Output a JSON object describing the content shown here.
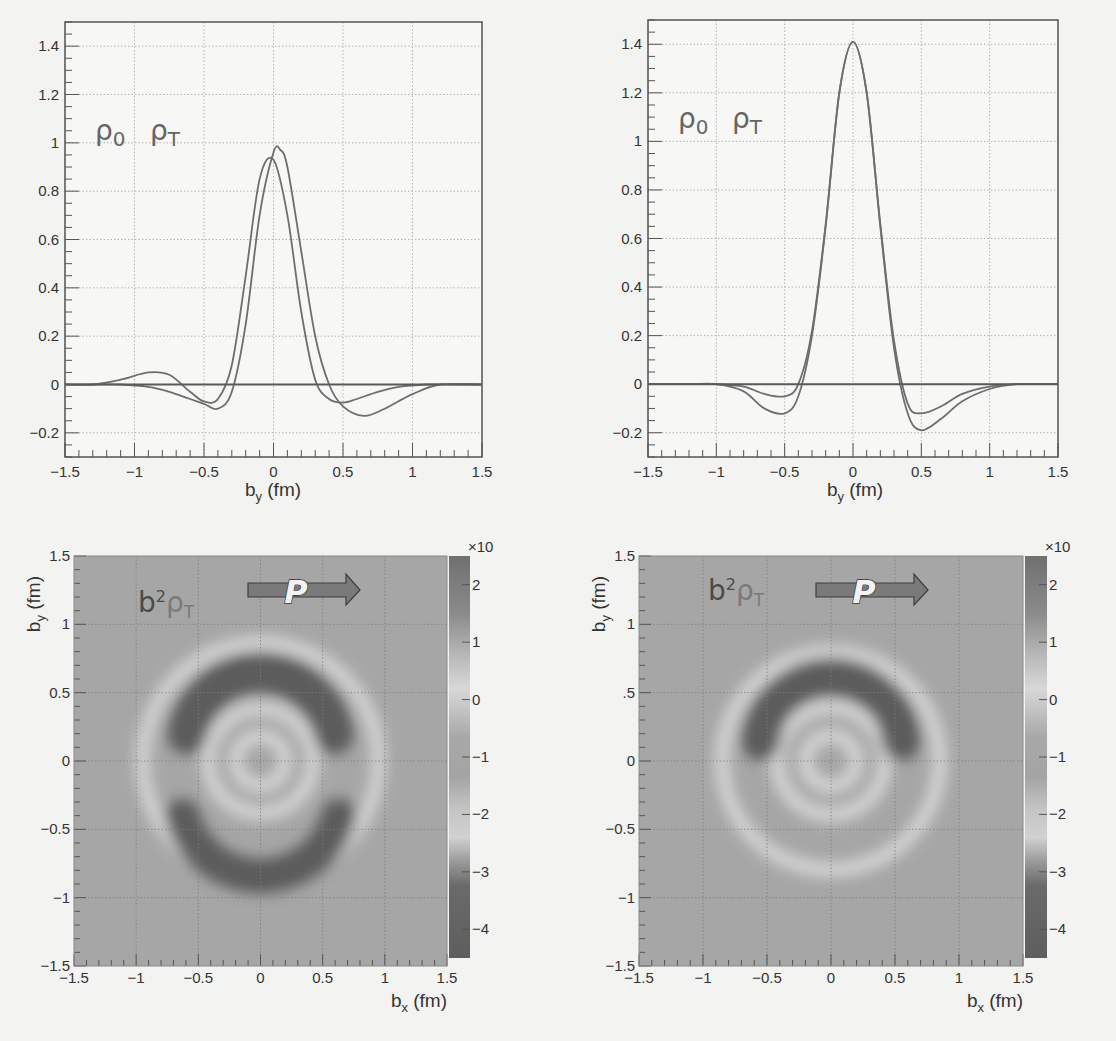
{
  "chart_data": [
    {
      "id": "top_left",
      "type": "line",
      "title": "",
      "legend": [
        "ρ0",
        "ρT"
      ],
      "xlabel": "b_y (fm)",
      "ylabel": "",
      "xlim": [
        -1.5,
        1.5
      ],
      "ylim": [
        -0.3,
        1.5
      ],
      "xticks": [
        "-1.5",
        "-1",
        "-0.5",
        "0",
        "0.5",
        "1",
        "1.5"
      ],
      "yticks": [
        "-0.2",
        "0",
        "0.2",
        "0.4",
        "0.6",
        "0.8",
        "1",
        "1.2",
        "1.4"
      ],
      "grid": true,
      "series": [
        {
          "name": "ρ0",
          "x": [
            -1.5,
            -1.3,
            -1.1,
            -0.9,
            -0.75,
            -0.6,
            -0.5,
            -0.4,
            -0.3,
            -0.2,
            -0.1,
            0,
            0.1,
            0.2,
            0.3,
            0.4,
            0.5,
            0.6,
            0.75,
            0.9,
            1.1,
            1.3,
            1.5
          ],
          "y": [
            0,
            0,
            0.02,
            0.05,
            0.04,
            -0.03,
            -0.07,
            -0.06,
            0.08,
            0.45,
            0.85,
            0.93,
            0.7,
            0.3,
            0.02,
            -0.06,
            -0.075,
            -0.06,
            -0.03,
            -0.01,
            0,
            0,
            0
          ]
        },
        {
          "name": "ρT",
          "x": [
            -1.5,
            -1.3,
            -1.1,
            -0.9,
            -0.75,
            -0.6,
            -0.5,
            -0.4,
            -0.3,
            -0.2,
            -0.1,
            0,
            0.05,
            0.1,
            0.2,
            0.3,
            0.4,
            0.5,
            0.65,
            0.8,
            1.0,
            1.2,
            1.5
          ],
          "y": [
            0,
            0,
            0,
            -0.01,
            -0.03,
            -0.06,
            -0.08,
            -0.1,
            -0.03,
            0.25,
            0.7,
            0.96,
            0.97,
            0.9,
            0.55,
            0.2,
            0.0,
            -0.09,
            -0.13,
            -0.1,
            -0.04,
            0,
            0
          ]
        },
        {
          "name": "zero",
          "x": [
            -1.5,
            1.5
          ],
          "y": [
            0,
            0
          ]
        }
      ]
    },
    {
      "id": "top_right",
      "type": "line",
      "title": "",
      "legend": [
        "ρ0",
        "ρT"
      ],
      "xlabel": "b_y (fm)",
      "ylabel": "",
      "xlim": [
        -1.5,
        1.5
      ],
      "ylim": [
        -0.3,
        1.5
      ],
      "xticks": [
        "-1.5",
        "-1",
        "-0.5",
        "0",
        "0.5",
        "1",
        "1.5"
      ],
      "yticks": [
        "-0.2",
        "0",
        "0.2",
        "0.4",
        "0.6",
        "0.8",
        "1",
        "1.2",
        "1.4"
      ],
      "grid": true,
      "series": [
        {
          "name": "ρ0",
          "x": [
            -1.5,
            -1.2,
            -1.0,
            -0.8,
            -0.65,
            -0.5,
            -0.4,
            -0.3,
            -0.2,
            -0.1,
            0,
            0.1,
            0.2,
            0.3,
            0.4,
            0.5,
            0.65,
            0.8,
            1.0,
            1.2,
            1.5
          ],
          "y": [
            0,
            0,
            0,
            -0.03,
            -0.1,
            -0.12,
            -0.05,
            0.2,
            0.65,
            1.2,
            1.41,
            1.2,
            0.65,
            0.15,
            -0.12,
            -0.19,
            -0.14,
            -0.07,
            -0.02,
            0,
            0
          ]
        },
        {
          "name": "ρT",
          "x": [
            -1.5,
            -1.2,
            -1.0,
            -0.8,
            -0.65,
            -0.5,
            -0.4,
            -0.3,
            -0.2,
            -0.1,
            0,
            0.1,
            0.2,
            0.3,
            0.4,
            0.5,
            0.65,
            0.8,
            1.0,
            1.2,
            1.5
          ],
          "y": [
            0,
            0,
            0,
            -0.01,
            -0.04,
            -0.05,
            0.0,
            0.22,
            0.66,
            1.2,
            1.41,
            1.2,
            0.66,
            0.18,
            -0.08,
            -0.12,
            -0.09,
            -0.04,
            -0.01,
            0,
            0
          ]
        },
        {
          "name": "zero",
          "x": [
            -1.5,
            1.5
          ],
          "y": [
            0,
            0
          ]
        }
      ]
    },
    {
      "id": "bottom_left",
      "type": "heatmap",
      "annotation": "b²ρT",
      "arrow_label": "P",
      "xlabel": "b_x (fm)",
      "ylabel": "b_y (fm)",
      "xlim": [
        -1.5,
        1.5
      ],
      "ylim": [
        -1.5,
        1.5
      ],
      "xticks": [
        "-1.5",
        "-1",
        "-0.5",
        "0",
        "0.5",
        "1",
        "1.5"
      ],
      "yticks": [
        "-1.5",
        "-1",
        "-0.5",
        "0",
        "0.5",
        "1",
        "1.5"
      ],
      "colorbar": {
        "ticks": [
          "2",
          "1",
          "0",
          "-1",
          "-2",
          "-3",
          "-4"
        ],
        "multiplier": "×10",
        "range": [
          -4.5,
          2.5
        ]
      },
      "features": [
        {
          "kind": "dark_arc",
          "cx": 0,
          "cy": 0.1,
          "r": 0.6,
          "width": 0.32,
          "from_deg": 10,
          "to_deg": 170
        },
        {
          "kind": "dark_arc",
          "cx": 0,
          "cy": -0.25,
          "r": 0.65,
          "width": 0.28,
          "from_deg": 195,
          "to_deg": 345
        },
        {
          "kind": "light_ring",
          "r": 0.95
        },
        {
          "kind": "light_ring",
          "r": 0.42
        },
        {
          "kind": "light_ring",
          "r": 0.2
        }
      ]
    },
    {
      "id": "bottom_right",
      "type": "heatmap",
      "annotation": "b²ρT",
      "arrow_label": "P",
      "xlabel": "b_x (fm)",
      "ylabel": "b_y (fm)",
      "xlim": [
        -1.5,
        1.5
      ],
      "ylim": [
        -1.5,
        1.5
      ],
      "xticks": [
        "-1.5",
        "-1",
        "-0.5",
        "0",
        "0.5",
        "1",
        "1.5"
      ],
      "yticks": [
        "-1.5",
        "-1",
        "-0.5",
        "0",
        ".5",
        "1",
        "1.5"
      ],
      "colorbar": {
        "ticks": [
          "2",
          "1",
          "0",
          "-1",
          "-2",
          "-3",
          "-4"
        ],
        "multiplier": "×10",
        "range": [
          -4.5,
          2.5
        ]
      },
      "features": [
        {
          "kind": "dark_arc",
          "cx": 0,
          "cy": 0.1,
          "r": 0.55,
          "width": 0.3,
          "from_deg": 5,
          "to_deg": 175
        },
        {
          "kind": "light_ring",
          "r": 0.85
        },
        {
          "kind": "light_ring",
          "r": 0.42
        },
        {
          "kind": "light_ring",
          "r": 0.2
        }
      ]
    }
  ],
  "colors": {
    "curve": "#6e6e6e",
    "axis": "#555555",
    "grid": "#b5b5b5",
    "heat_bg": "#a6a6a6",
    "heat_dark": "#5b5b5b",
    "heat_light": "#d6d6d6"
  }
}
